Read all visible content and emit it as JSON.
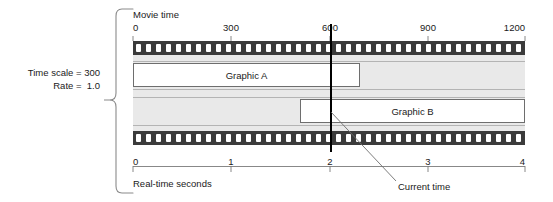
{
  "figure": {
    "left_annotation": {
      "time_scale_label": "Time scale = 300",
      "rate_label": "Rate =  1.0"
    },
    "top_axis": {
      "title": "Movie time",
      "ticks": [
        {
          "label": "0",
          "value": 0,
          "x": 133
        },
        {
          "label": "300",
          "value": 300,
          "x": 231
        },
        {
          "label": "600",
          "value": 600,
          "x": 330
        },
        {
          "label": "900",
          "value": 900,
          "x": 428
        },
        {
          "label": "1200",
          "value": 1200,
          "x": 525
        }
      ],
      "range": [
        0,
        1200
      ]
    },
    "bottom_axis": {
      "title": "Real-time seconds",
      "ticks": [
        {
          "label": "0",
          "value": 0,
          "x": 133
        },
        {
          "label": "1",
          "value": 1,
          "x": 231
        },
        {
          "label": "2",
          "value": 2,
          "x": 330
        },
        {
          "label": "3",
          "value": 3,
          "x": 428
        },
        {
          "label": "4",
          "value": 4,
          "x": 525
        }
      ],
      "range": [
        0,
        4
      ]
    },
    "tracks": [
      {
        "name": "Graphic A",
        "start_movie_time": 0,
        "end_movie_time": 695
      },
      {
        "name": "Graphic B",
        "start_movie_time": 510,
        "end_movie_time": 1200
      }
    ],
    "current_time": {
      "label": "Current time",
      "movie_time": 600,
      "real_time_seconds": 2
    },
    "colors": {
      "perforation_band": "#3b3b3b",
      "strip_interior": "#e9e9e9",
      "bar_fill": "#ffffff",
      "bar_border": "#6e6e6e",
      "current_time_line": "#000000",
      "axis_line": "#7a7a7a",
      "text": "#1a1a1a"
    },
    "film": {
      "perforation_count": 39,
      "perforation_pitch": 10
    }
  }
}
